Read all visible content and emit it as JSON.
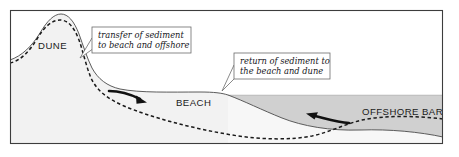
{
  "figure": {
    "type": "cross-section-diagram",
    "frame": {
      "border_color": "#3d3d3d"
    },
    "palette": {
      "land": "#f2f2f2",
      "water": "#d0d0d0",
      "submerged_land": "#f7f7f7",
      "profile_solid": "#4a4a4a",
      "profile_dashed": "#1a1a1a",
      "arrow": "#111111",
      "callout_border": "#6b6b6b",
      "background": "#ffffff"
    }
  },
  "labels": {
    "dune": "DUNE",
    "beach": "BEACH",
    "offshore_bar": "OFFSHORE BAR"
  },
  "callouts": [
    {
      "id": "transfer",
      "line1": "transfer of sediment",
      "line2": "to beach and offshore"
    },
    {
      "id": "return",
      "line1": "return of sediment to",
      "line2": "the beach and dune"
    }
  ],
  "arrows": [
    {
      "id": "seaward-transport-arrow",
      "direction": "right",
      "meaning": "transfer of sediment to beach and offshore"
    },
    {
      "id": "landward-transport-arrow",
      "direction": "left",
      "meaning": "return of sediment to the beach and dune"
    }
  ],
  "profiles": [
    {
      "id": "storm-profile-solid",
      "style": "solid",
      "meaning": "profile with dune and beach built up"
    },
    {
      "id": "eroded-profile-dashed",
      "style": "dashed",
      "meaning": "profile after sediment transfer offshore"
    }
  ]
}
